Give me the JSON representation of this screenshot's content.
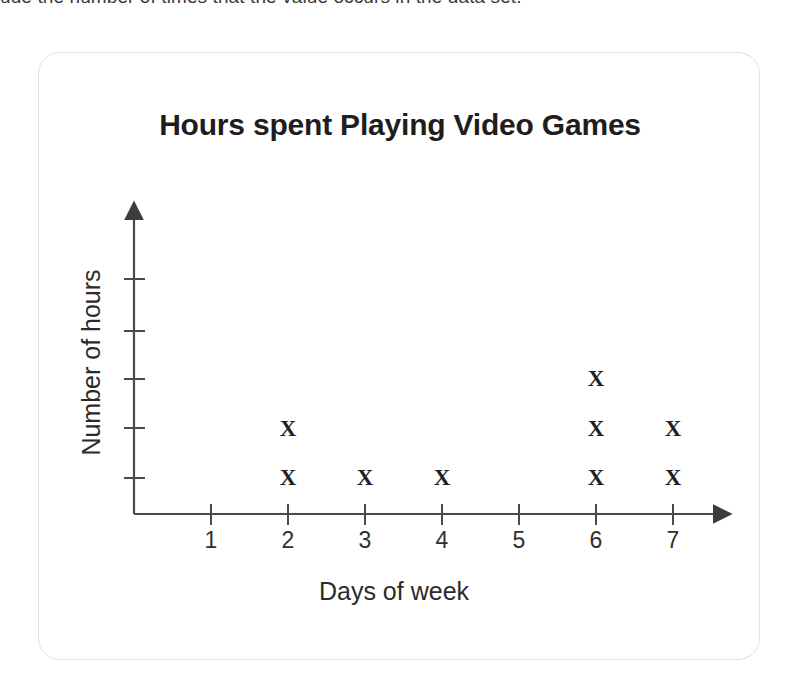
{
  "prompt_text": "ude the number of times that the value occurs in the data set.",
  "card": {
    "border_color": "#e2e2e4"
  },
  "chart_data": {
    "type": "scatter",
    "plot_style": "dot-plot-x-markers",
    "title": "Hours spent Playing Video Games",
    "xlabel": "Days of week",
    "ylabel": "Number of hours",
    "categories": [
      "1",
      "2",
      "3",
      "4",
      "5",
      "6",
      "7"
    ],
    "x": [
      1,
      2,
      3,
      4,
      5,
      6,
      7
    ],
    "values": [
      0,
      2,
      1,
      1,
      0,
      3,
      2
    ],
    "marker": "X",
    "marker_color": "#1f1f1f",
    "axis_color": "#4a4a4a",
    "grid": false,
    "legend": null,
    "xlim": [
      0,
      7.6
    ],
    "ylim": [
      0,
      5.6
    ],
    "y_tick_count": 5,
    "y_tick_labels": [],
    "points": [
      {
        "day": 2,
        "level": 1
      },
      {
        "day": 2,
        "level": 2
      },
      {
        "day": 3,
        "level": 1
      },
      {
        "day": 4,
        "level": 1
      },
      {
        "day": 6,
        "level": 1
      },
      {
        "day": 6,
        "level": 2
      },
      {
        "day": 6,
        "level": 3
      },
      {
        "day": 7,
        "level": 1
      },
      {
        "day": 7,
        "level": 2
      }
    ]
  }
}
